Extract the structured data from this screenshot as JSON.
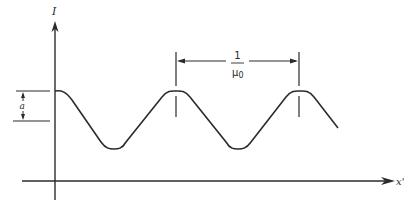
{
  "diagram": {
    "type": "periodic-waveform",
    "y_axis": {
      "label": "I"
    },
    "x_axis": {
      "label": "x'"
    },
    "amplitude_label": "a",
    "period_label": {
      "numerator": "1",
      "denominator": "μ0",
      "denominator_base": "μ",
      "denominator_sub": "0"
    },
    "colors": {
      "line": "#2b2b2b",
      "background": "#ffffff"
    }
  }
}
